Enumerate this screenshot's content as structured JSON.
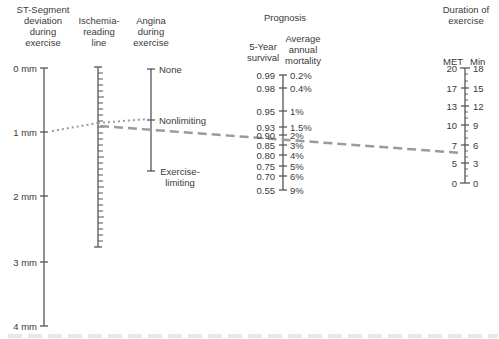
{
  "headers": {
    "st_segment": [
      "ST-Segment",
      "deviation",
      "during",
      "exercise"
    ],
    "ischemia": [
      "Ischemia-",
      "reading",
      "line"
    ],
    "angina": [
      "Angina",
      "during",
      "exercise"
    ],
    "prognosis": "Prognosis",
    "survival": [
      "5-Year",
      "survival"
    ],
    "mortality": [
      "Average",
      "annual",
      "mortality"
    ],
    "duration": [
      "Duration of",
      "exercise"
    ],
    "met": "MET",
    "min": "Min"
  },
  "st_scale": [
    {
      "label": "0 mm",
      "y": 68
    },
    {
      "label": "1 mm",
      "y": 132
    },
    {
      "label": "2 mm",
      "y": 196
    },
    {
      "label": "3 mm",
      "y": 262
    },
    {
      "label": "4 mm",
      "y": 326
    }
  ],
  "angina_scale": [
    {
      "label": "None",
      "y": 69
    },
    {
      "label": "Nonlimiting",
      "y": 120
    },
    {
      "label": "Exercise-",
      "label2": "limiting",
      "y": 171
    }
  ],
  "prognosis_scale": [
    {
      "survival": "0.99",
      "mortality": "0.2%",
      "y": 75
    },
    {
      "survival": "0.98",
      "mortality": "0.4%",
      "y": 88
    },
    {
      "survival": "0.95",
      "mortality": "1%",
      "y": 111
    },
    {
      "survival": "0.93",
      "mortality": "1.5%",
      "y": 127
    },
    {
      "survival": "0.90",
      "mortality": "2%",
      "y": 135
    },
    {
      "survival": "0.85",
      "mortality": "3%",
      "y": 145
    },
    {
      "survival": "0.80",
      "mortality": "4%",
      "y": 155
    },
    {
      "survival": "0.75",
      "mortality": "5%",
      "y": 166
    },
    {
      "survival": "0.70",
      "mortality": "6%",
      "y": 176
    },
    {
      "survival": "0.55",
      "mortality": "9%",
      "y": 190
    }
  ],
  "duration_scale": [
    {
      "met": "20",
      "min": "18",
      "y": 68
    },
    {
      "met": "17",
      "min": "15",
      "y": 88
    },
    {
      "met": "13",
      "min": "12",
      "y": 106
    },
    {
      "met": "10",
      "min": "9",
      "y": 125
    },
    {
      "met": "7",
      "min": "6",
      "y": 145
    },
    {
      "met": "5",
      "min": "3",
      "y": 163
    },
    {
      "met": "0",
      "min": "0",
      "y": 183
    }
  ],
  "colors": {
    "axis": "#555555",
    "text": "#3a3a3a",
    "guide": "#9a9a9a"
  }
}
